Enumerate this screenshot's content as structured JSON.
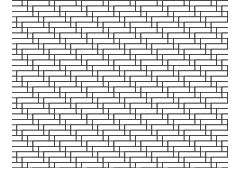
{
  "figure": {
    "title": "",
    "pattern": "herringbone",
    "brick_aspect_ratio": 4,
    "stroke_color": "#333333",
    "fill_color": "#ffffff",
    "background_color": "#ffffff"
  }
}
